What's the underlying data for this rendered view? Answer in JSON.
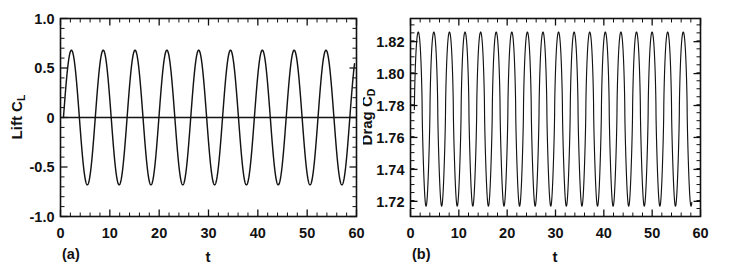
{
  "figure": {
    "background": "#ffffff",
    "ink_color": "#131313"
  },
  "panels": [
    {
      "id": "a",
      "panel_label": "(a)",
      "ylabel_main": "Lift C",
      "ylabel_sub": "L",
      "xlabel": "t"
    },
    {
      "id": "b",
      "panel_label": "(b)",
      "ylabel_main": "Drag C",
      "ylabel_sub": "D",
      "xlabel": "t"
    }
  ],
  "chart_data": [
    {
      "type": "line",
      "id": "lift-coefficient",
      "title": "",
      "panel_label": "(a)",
      "xlabel": "t",
      "ylabel": "Lift C_L",
      "xlim": [
        0,
        60
      ],
      "ylim": [
        -1.0,
        1.0
      ],
      "xticks": [
        0,
        10,
        20,
        30,
        40,
        50,
        60
      ],
      "xticklabels": [
        "0",
        "10",
        "20",
        "30",
        "40",
        "50",
        "60"
      ],
      "yticks": [
        -1.0,
        -0.5,
        0,
        0.5,
        1.0
      ],
      "yticklabels": [
        "-1.0",
        "-0.5",
        "0",
        "0.5",
        "1.0"
      ],
      "xminor_interval": 2,
      "yminor_interval": 0.1,
      "grid": false,
      "legend": null,
      "series": [
        {
          "name": "C_L(t)",
          "waveform": "sine",
          "amplitude": 0.68,
          "mean": 0.0,
          "period": 6.45,
          "phase_deg": 0,
          "n_cycles": 9,
          "start_t": 0.6,
          "end_t": 59.6
        },
        {
          "name": "zero reference",
          "waveform": "constant",
          "value": 0.0,
          "start_t": 0.0,
          "end_t": 60.0
        }
      ],
      "peak_value": 0.68,
      "trough_value": -0.68,
      "peak_times": [
        2.6,
        9.05,
        15.5,
        21.95,
        28.4,
        34.85,
        41.3,
        47.75,
        54.2
      ],
      "trough_times": [
        5.83,
        12.28,
        18.73,
        25.18,
        31.63,
        38.08,
        44.53,
        50.98,
        57.43
      ]
    },
    {
      "type": "line",
      "id": "drag-coefficient",
      "title": "",
      "panel_label": "(b)",
      "xlabel": "t",
      "ylabel": "Drag C_D",
      "xlim": [
        0,
        60
      ],
      "ylim": [
        1.7105,
        1.8345
      ],
      "xticks": [
        0,
        10,
        20,
        30,
        40,
        50,
        60
      ],
      "xticklabels": [
        "0",
        "10",
        "20",
        "30",
        "40",
        "50",
        "60"
      ],
      "yticks": [
        1.72,
        1.74,
        1.76,
        1.78,
        1.8,
        1.82
      ],
      "yticklabels": [
        "1.72",
        "1.74",
        "1.76",
        "1.78",
        "1.80",
        "1.82"
      ],
      "xminor_interval": 2,
      "yminor_interval": 0.005,
      "grid": false,
      "legend": null,
      "series": [
        {
          "name": "C_D(t)",
          "waveform": "peaked-sine",
          "amplitude": 0.0545,
          "mean": 1.7745,
          "period": 3.225,
          "phase_deg": 0,
          "n_cycles": 18,
          "start_t": 0.8,
          "end_t": 58.2
        }
      ],
      "peak_value": 1.829,
      "trough_value": 1.7205,
      "mean_value": 1.7745,
      "frequency_ratio_to_lift": 2
    }
  ]
}
